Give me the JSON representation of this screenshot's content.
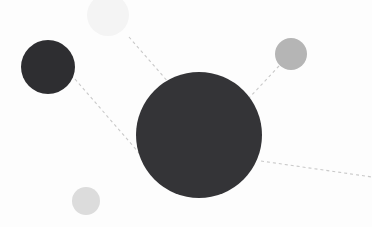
{
  "canvas": {
    "width": 372,
    "height": 227,
    "background_color": "#fdfdfd",
    "title": "node-cluster-diagram"
  },
  "palette": {
    "hub_fill": "#343437",
    "satellite_dark_fill": "#2e2e31",
    "satellite_mid_fill": "#b5b5b5",
    "satellite_light_fill": "#dcdcdc",
    "satellite_faint_fill": "#f4f4f4",
    "edge_stroke": "#c9c9c9"
  },
  "nodes": [
    {
      "id": "hub",
      "name": "hub-node",
      "cx": 199,
      "cy": 135,
      "r": 63,
      "fill": "#343437",
      "opacity": 1
    },
    {
      "id": "satellite-upper-left",
      "name": "satellite-node-upper-left",
      "cx": 48,
      "cy": 67,
      "r": 27,
      "fill": "#2e2e31",
      "opacity": 1
    },
    {
      "id": "satellite-upper-right",
      "name": "satellite-node-upper-right",
      "cx": 291,
      "cy": 54,
      "r": 16,
      "fill": "#b5b5b5",
      "opacity": 1
    },
    {
      "id": "satellite-lower-left",
      "name": "satellite-node-lower-left",
      "cx": 86,
      "cy": 201,
      "r": 14,
      "fill": "#dcdcdc",
      "opacity": 1
    },
    {
      "id": "satellite-top-faint",
      "name": "satellite-node-top-faint",
      "cx": 108,
      "cy": 15,
      "r": 21,
      "fill": "#f4f4f4",
      "opacity": 1
    }
  ],
  "edges": [
    {
      "id": "edge-hub-upper-left",
      "name": "edge-hub-to-upper-left",
      "x1": 75,
      "y1": 79,
      "x2": 140,
      "y2": 154,
      "stroke": "#c9c9c9",
      "stroke_width": 1.1,
      "dash": "3 3"
    },
    {
      "id": "edge-hub-top-faint",
      "name": "edge-hub-to-top-faint",
      "x1": 129,
      "y1": 37,
      "x2": 169,
      "y2": 83,
      "stroke": "#c9c9c9",
      "stroke_width": 1.1,
      "dash": "3 3"
    },
    {
      "id": "edge-hub-upper-right",
      "name": "edge-hub-to-upper-right",
      "x1": 279,
      "y1": 66,
      "x2": 249,
      "y2": 98,
      "stroke": "#c9c9c9",
      "stroke_width": 1.1,
      "dash": "3 3"
    },
    {
      "id": "edge-hub-right-offscreen",
      "name": "edge-hub-to-right-offscreen",
      "x1": 261,
      "y1": 161,
      "x2": 372,
      "y2": 177,
      "stroke": "#c9c9c9",
      "stroke_width": 1.1,
      "dash": "3 3"
    }
  ]
}
